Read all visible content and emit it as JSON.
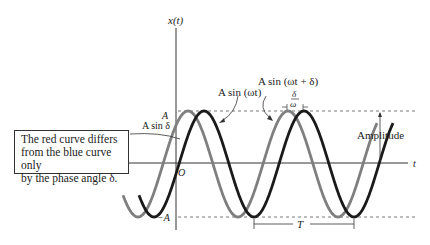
{
  "diagram": {
    "axes": {
      "y_label": "x(t)",
      "x_label": "t",
      "origin_label": "O"
    },
    "levels": {
      "top_label": "A",
      "bottom_label": "−A",
      "sin_delta_label": "A sin δ"
    },
    "curves": [
      {
        "name": "blue-curve",
        "label": "A sin (ωt)",
        "color": "#1a1a1a",
        "phase_shift_px": 0
      },
      {
        "name": "red-curve",
        "label": "A sin (ωt + δ)",
        "color": "#7f7f7f",
        "phase_shift_px": -16
      }
    ],
    "annotations": {
      "phase_offset_numerator": "δ",
      "phase_offset_denominator": "ω",
      "amplitude_label": "Amplitude",
      "period_label": "T"
    },
    "callout": {
      "line1": "The red curve differs",
      "line2": "from the blue curve only",
      "line3": "by the phase angle δ."
    }
  }
}
